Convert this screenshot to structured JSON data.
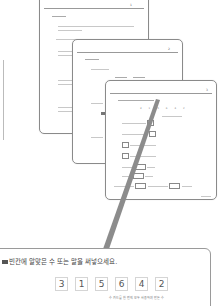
{
  "callout": {
    "instruction": "빈칸에 알맞은 수 또는 말을 써넣으세요.",
    "digits": [
      "3",
      "1",
      "5",
      "6",
      "4",
      "2"
    ],
    "caption": "수 카드를 한 번씩 모두 사용하여 만든 수"
  },
  "pages": [
    {
      "page_number": "1"
    },
    {
      "page_number": "2"
    },
    {
      "page_number": "3"
    }
  ],
  "page3": {
    "digits": [
      "3",
      "1",
      "5",
      "6",
      "4",
      "2"
    ]
  },
  "colors": {
    "border": "#8a8a8a",
    "pointer": "#8c8c8c",
    "digit_border": "#d5d5d5",
    "text": "#555555"
  }
}
